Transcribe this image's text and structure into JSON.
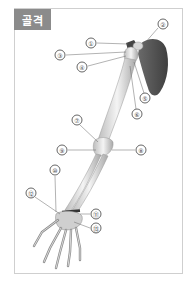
{
  "header": {
    "title": "골격"
  },
  "colors": {
    "badge_bg": "#8b8b8b",
    "badge_text": "#ffffff",
    "border": "#cfcfcf",
    "bone": "#e8e8e8",
    "scapula": "#555555"
  },
  "labels": [
    {
      "id": "1",
      "text": "①",
      "x": 91,
      "y": 43
    },
    {
      "id": "2",
      "text": "②",
      "x": 163,
      "y": 24
    },
    {
      "id": "3",
      "text": "③",
      "x": 60,
      "y": 55
    },
    {
      "id": "4",
      "text": "④",
      "x": 82,
      "y": 67
    },
    {
      "id": "5",
      "text": "⑤",
      "x": 145,
      "y": 98
    },
    {
      "id": "6",
      "text": "⑥",
      "x": 137,
      "y": 114
    },
    {
      "id": "7",
      "text": "⑦",
      "x": 77,
      "y": 120
    },
    {
      "id": "8",
      "text": "⑧",
      "x": 141,
      "y": 150
    },
    {
      "id": "9",
      "text": "⑨",
      "x": 62,
      "y": 150
    },
    {
      "id": "10",
      "text": "⑩",
      "x": 55,
      "y": 170
    },
    {
      "id": "11",
      "text": "⑪",
      "x": 96,
      "y": 214
    },
    {
      "id": "12",
      "text": "⑫",
      "x": 31,
      "y": 193
    },
    {
      "id": "13",
      "text": "⑬",
      "x": 96,
      "y": 228
    }
  ]
}
